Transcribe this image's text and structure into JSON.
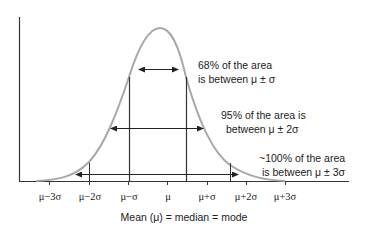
{
  "diagram": {
    "title": "",
    "type": "normal-distribution",
    "x_axis_label": "Mean (μ) = median = mode",
    "tick_labels": [
      "μ−3σ",
      "μ−2σ",
      "μ−σ",
      "μ",
      "μ+σ",
      "μ+2σ",
      "μ+3σ"
    ],
    "annotations": [
      {
        "line1": "68% of the area",
        "line2": "is between μ ± σ"
      },
      {
        "line1": "95% of the area is",
        "line2": "between μ ± 2σ"
      },
      {
        "line1": "~100% of the area",
        "line2": "is between μ ± 3σ"
      }
    ],
    "colors": {
      "curve": "#a8a8a8",
      "axis": "#333333",
      "arrows": "#222222",
      "text": "#222222"
    }
  }
}
